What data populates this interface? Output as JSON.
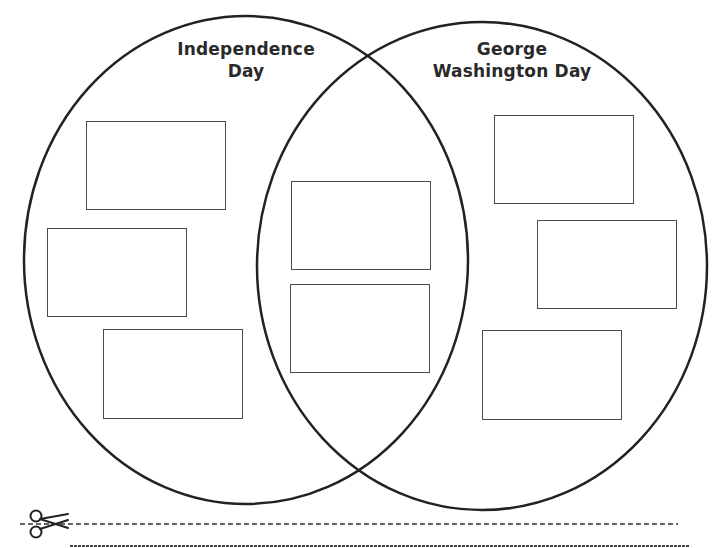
{
  "diagram": {
    "type": "venn",
    "sets": [
      {
        "id": "left",
        "title_lines": [
          "Independence",
          "Day"
        ],
        "answer_boxes": 3
      },
      {
        "id": "right",
        "title_lines": [
          "George",
          "Washington Day"
        ],
        "answer_boxes": 3
      }
    ],
    "overlap": {
      "answer_boxes": 2
    },
    "colors": {
      "stroke": "#222222",
      "box_border": "#4a4a4a",
      "background": "#ffffff"
    }
  },
  "footer": {
    "cut_line_icon": "scissors-icon"
  }
}
